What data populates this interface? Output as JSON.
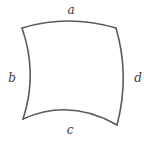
{
  "diagram": {
    "type": "curvilinear-quadrilateral",
    "stroke_color": "#5a5a5a",
    "label_color": "#3a3a3a",
    "background": "#ffffff",
    "labels": {
      "a": "a",
      "b": "b",
      "c": "c",
      "d": "d"
    },
    "label_positions": {
      "a": [
        71,
        10
      ],
      "b": [
        12,
        78
      ],
      "c": [
        70,
        130
      ],
      "d": [
        138,
        78
      ]
    },
    "corners": {
      "top_left": [
        22,
        28
      ],
      "top_right": [
        116,
        28
      ],
      "bottom_right": [
        117,
        125
      ],
      "bottom_left": [
        23,
        119
      ]
    },
    "edges": [
      {
        "side": "a",
        "path": "M22 28 Q68 14 116 28"
      },
      {
        "side": "d",
        "path": "M116 28 Q130 76 117 125"
      },
      {
        "side": "c",
        "path": "M117 125 Q70 98 23 119"
      },
      {
        "side": "b",
        "path": "M23 119 Q38 74 22 28"
      }
    ]
  }
}
